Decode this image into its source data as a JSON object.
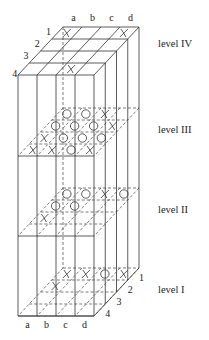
{
  "columns": [
    "a",
    "b",
    "c",
    "d"
  ],
  "rows": [
    "1",
    "2",
    "3",
    "4"
  ],
  "levels": [
    {
      "name": "level IV",
      "key": "IV",
      "label_y": 47,
      "plane_y": 27,
      "visible": true,
      "marks": [
        {
          "row": 0,
          "col": 0,
          "m": "X"
        },
        {
          "row": 0,
          "col": 3,
          "m": "X"
        },
        {
          "row": 3,
          "col": 2,
          "m": "X"
        }
      ]
    },
    {
      "name": "level III",
      "key": "III",
      "label_y": 133,
      "plane_y": 108,
      "visible": false,
      "marks": [
        {
          "row": 0,
          "col": 0,
          "m": "O"
        },
        {
          "row": 0,
          "col": 1,
          "m": "O"
        },
        {
          "row": 0,
          "col": 2,
          "m": "X"
        },
        {
          "row": 1,
          "col": 0,
          "m": "O"
        },
        {
          "row": 1,
          "col": 1,
          "m": "O"
        },
        {
          "row": 1,
          "col": 2,
          "m": "O"
        },
        {
          "row": 1,
          "col": 3,
          "m": "X"
        },
        {
          "row": 2,
          "col": 0,
          "m": "X"
        },
        {
          "row": 2,
          "col": 1,
          "m": "O"
        },
        {
          "row": 2,
          "col": 2,
          "m": "O"
        },
        {
          "row": 2,
          "col": 3,
          "m": "O"
        },
        {
          "row": 3,
          "col": 0,
          "m": "X"
        },
        {
          "row": 3,
          "col": 1,
          "m": "X"
        },
        {
          "row": 3,
          "col": 2,
          "m": "O"
        },
        {
          "row": 3,
          "col": 3,
          "m": "X"
        }
      ]
    },
    {
      "name": "level II",
      "key": "II",
      "label_y": 213,
      "plane_y": 188,
      "visible": false,
      "marks": [
        {
          "row": 0,
          "col": 0,
          "m": "O"
        },
        {
          "row": 0,
          "col": 1,
          "m": "O"
        },
        {
          "row": 0,
          "col": 2,
          "m": "X"
        },
        {
          "row": 0,
          "col": 3,
          "m": "O"
        },
        {
          "row": 1,
          "col": 0,
          "m": "O"
        },
        {
          "row": 1,
          "col": 1,
          "m": "O"
        },
        {
          "row": 2,
          "col": 0,
          "m": "X"
        }
      ]
    },
    {
      "name": "level I",
      "key": "I",
      "label_y": 293,
      "plane_y": 268,
      "visible": false,
      "marks": [
        {
          "row": 0,
          "col": 0,
          "m": "X"
        },
        {
          "row": 0,
          "col": 1,
          "m": "X"
        },
        {
          "row": 0,
          "col": 2,
          "m": "O"
        },
        {
          "row": 0,
          "col": 3,
          "m": "X"
        },
        {
          "row": 1,
          "col": 0,
          "m": "X"
        }
      ]
    }
  ],
  "geometry": {
    "back_left_x": 63,
    "cell_w": 19,
    "row_dx": -11.25,
    "row_dy": 12,
    "level_x": 158
  }
}
